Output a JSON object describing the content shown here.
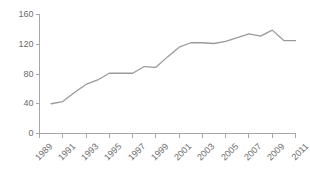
{
  "chart_data": {
    "type": "line",
    "title": "",
    "subtitle": "",
    "xlabel": "",
    "ylabel": "",
    "xlim": [
      1989,
      2011
    ],
    "ylim": [
      0,
      160
    ],
    "grid": false,
    "legend": "none",
    "line_color": "#9a9a9a",
    "axis_color": "#a6a6a6",
    "tick_label_color": "#6d6d6d",
    "yticks": [
      0,
      40,
      80,
      120,
      160
    ],
    "ytick_labels": [
      "0",
      "40",
      "80",
      "120",
      "160"
    ],
    "xticks": [
      1989,
      1991,
      1993,
      1995,
      1997,
      1999,
      2001,
      2003,
      2005,
      2007,
      2009,
      2011
    ],
    "xtick_labels": [
      "1989",
      "1991",
      "1993",
      "1995",
      "1997",
      "1999",
      "2001",
      "2003",
      "2005",
      "2007",
      "2009",
      "2011"
    ],
    "x": [
      1990,
      1991,
      1992,
      1993,
      1994,
      1995,
      1996,
      1997,
      1998,
      1999,
      2000,
      2001,
      2002,
      2003,
      2004,
      2005,
      2006,
      2007,
      2008,
      2009,
      2010,
      2011
    ],
    "values": [
      40,
      43,
      55,
      66,
      72,
      81,
      81,
      81,
      90,
      89,
      103,
      116,
      122,
      122,
      121,
      124,
      129,
      134,
      131,
      139,
      125,
      125
    ],
    "series": [
      {
        "name": "series-1",
        "values": [
          40,
          43,
          55,
          66,
          72,
          81,
          81,
          81,
          90,
          89,
          103,
          116,
          122,
          122,
          121,
          124,
          129,
          134,
          131,
          139,
          125,
          125
        ]
      }
    ]
  }
}
